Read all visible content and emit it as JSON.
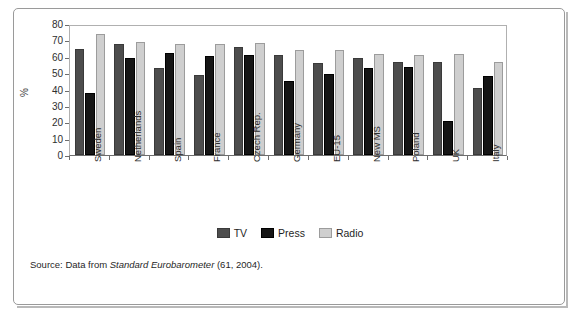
{
  "chart_data": {
    "type": "bar",
    "title": "",
    "subtitle": "",
    "xlabel": "",
    "ylabel": "%",
    "ylim": [
      0,
      80
    ],
    "ytick_step": 10,
    "yticks": [
      0,
      10,
      20,
      30,
      40,
      50,
      60,
      70,
      80
    ],
    "grid": false,
    "legend_position": "bottom-center",
    "categories": [
      "Sweden",
      "Netherlands",
      "Spain",
      "France",
      "Czech Rep.",
      "Germany",
      "EU-15",
      "New MS",
      "Poland",
      "UK",
      "Italy"
    ],
    "series": [
      {
        "name": "TV",
        "color": "#4d4d4d",
        "values": [
          65,
          68,
          53,
          49,
          66,
          61,
          56,
          59,
          57,
          56.5,
          41
        ]
      },
      {
        "name": "Press",
        "color": "#151515",
        "values": [
          38,
          59.5,
          62,
          60.5,
          61,
          45.5,
          49.5,
          53,
          53.5,
          21,
          48
        ]
      },
      {
        "name": "Radio",
        "color": "#cfcfcf",
        "values": [
          74,
          69,
          68,
          68,
          68.5,
          64,
          64,
          61.5,
          61,
          61.5,
          57
        ]
      }
    ],
    "annotations": []
  },
  "legend": {
    "items": [
      {
        "label": "TV",
        "key": "tv"
      },
      {
        "label": "Press",
        "key": "press"
      },
      {
        "label": "Radio",
        "key": "radio"
      }
    ]
  },
  "source": {
    "prefix": "Source: Data from ",
    "italic": "Standard Eurobarometer",
    "suffix": " (61, 2004)."
  }
}
